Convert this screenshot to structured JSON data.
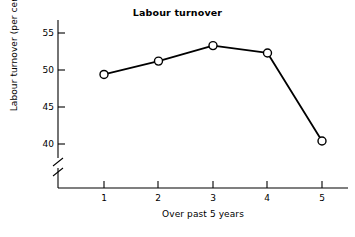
{
  "chart_data": {
    "type": "line",
    "title": "Labour turnover",
    "xlabel": "Over past 5 years",
    "ylabel": "Labour turnover (per cent)",
    "categories": [
      "1",
      "2",
      "3",
      "4",
      "5"
    ],
    "x": [
      1,
      2,
      3,
      4,
      5
    ],
    "values": [
      49.4,
      51.2,
      53.3,
      52.3,
      40.4
    ],
    "series": [
      {
        "name": "Labour turnover",
        "values": [
          49.4,
          51.2,
          53.3,
          52.3,
          40.4
        ]
      }
    ],
    "ylim": [
      38.5,
      56.5
    ],
    "xlim": [
      0.3,
      5.5
    ],
    "yticks": [
      40,
      45,
      50,
      55
    ],
    "ytick_labels": [
      "40",
      "45",
      "50",
      "55"
    ],
    "xticks": [
      1,
      2,
      3,
      4,
      5
    ],
    "xtick_labels": [
      "1",
      "2",
      "3",
      "4",
      "5"
    ],
    "grid": false,
    "legend": false,
    "legend_position": "none",
    "axis_break": true,
    "axis_break_axis": "y",
    "marker": "open-circle",
    "line_color": "#000000",
    "marker_face_color": "#ffffff",
    "marker_edge_color": "#000000",
    "background_color": "#ffffff"
  }
}
